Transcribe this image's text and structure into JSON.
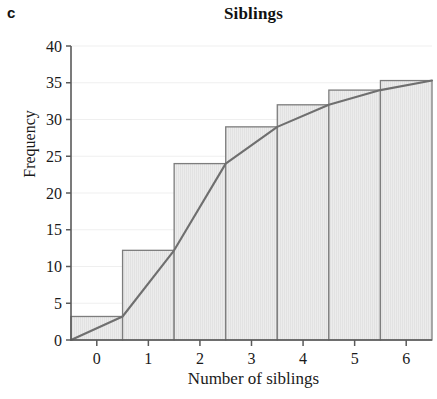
{
  "panel": {
    "label": "c"
  },
  "chart_data": {
    "type": "bar",
    "title": "Siblings",
    "xlabel": "Number of siblings",
    "ylabel": "Frequency",
    "categories": [
      "0",
      "1",
      "2",
      "3",
      "4",
      "5",
      "6"
    ],
    "values": [
      3.2,
      12.2,
      24,
      29,
      32,
      34,
      35.3
    ],
    "series": [
      {
        "name": "Cumulative frequency (bars)",
        "values": [
          3.2,
          12.2,
          24,
          29,
          32,
          34,
          35.3
        ]
      },
      {
        "name": "Cumulative frequency polygon",
        "type": "line",
        "x": [
          -0.5,
          0.5,
          1.5,
          2.5,
          3.5,
          4.5,
          5.5,
          6.5
        ],
        "values": [
          0,
          3.2,
          12.2,
          24,
          29,
          32,
          34,
          35.3
        ]
      }
    ],
    "ylim": [
      0,
      40
    ],
    "xlim": [
      -0.5,
      6.5
    ],
    "yticks": [
      "0",
      "5",
      "10",
      "15",
      "20",
      "25",
      "30",
      "35",
      "40"
    ],
    "xticks": [
      "0",
      "1",
      "2",
      "3",
      "4",
      "5",
      "6"
    ],
    "ytick_values": [
      0,
      5,
      10,
      15,
      20,
      25,
      30,
      35,
      40
    ],
    "xtick_values": [
      0,
      1,
      2,
      3,
      4,
      5,
      6
    ],
    "grid": true,
    "grid_axis": "y",
    "legend": "none",
    "bar_width": 1,
    "colors": {
      "bar_fill": "#e9e9e9",
      "bar_edge": "#7d7d7d",
      "line": "#6f6f6f",
      "grid": "#efefef",
      "axis": "#5a5a5a",
      "text": "#1a1a1a"
    }
  }
}
